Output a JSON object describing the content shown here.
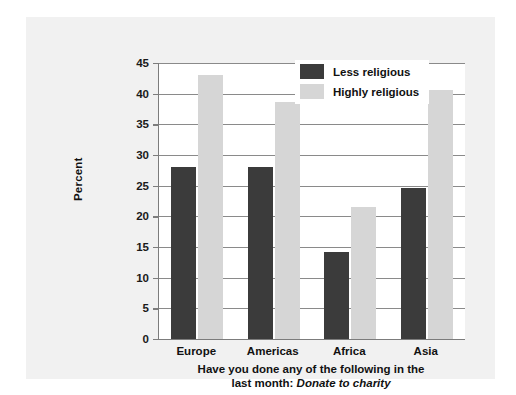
{
  "chart_data": {
    "type": "bar",
    "title": "",
    "caption_line1": "Have you done any of the following in the",
    "caption_line2_prefix": "last month: ",
    "caption_line2_emphasis": "Donate to charity",
    "categories": [
      "Europe",
      "Americas",
      "Africa",
      "Asia"
    ],
    "series": [
      {
        "name": "Less religious",
        "color": "#3b3b3b",
        "values": [
          28.0,
          28.0,
          14.2,
          24.6
        ]
      },
      {
        "name": "Highly religious",
        "color": "#d6d6d6",
        "values": [
          43.0,
          38.7,
          21.5,
          40.6
        ]
      }
    ],
    "xlabel": "",
    "ylabel": "Percent",
    "ylim": [
      0,
      45
    ],
    "yticks": [
      0,
      5,
      10,
      15,
      20,
      25,
      30,
      35,
      40,
      45
    ],
    "ytick_labels": [
      "0",
      "5",
      "10",
      "15",
      "20",
      "25",
      "30",
      "35",
      "40",
      "45"
    ],
    "grid": "horizontal",
    "legend_position": "top-right-inside"
  },
  "colors": {
    "panel_background": "#f1f1f1",
    "plot_background": "#ffffff",
    "axis": "#7c7c7c",
    "gridline": "#8a8a8a",
    "text": "#111111"
  }
}
